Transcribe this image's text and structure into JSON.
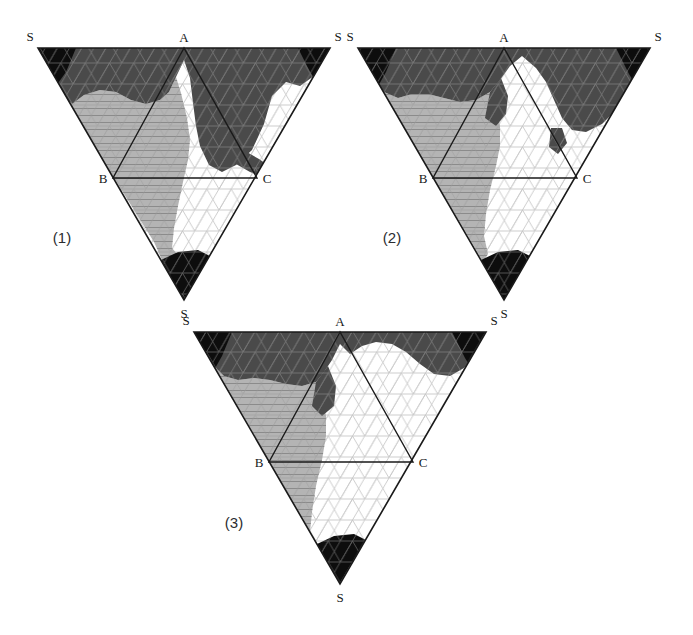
{
  "figure": {
    "type": "ternary-phase-diagrams",
    "panel_count": 3,
    "background_color": "#ffffff",
    "shared_vertex_labels": {
      "top_left": "S",
      "top_right": "S",
      "bottom": "S",
      "inner_apex": "A",
      "inner_left": "B",
      "inner_right": "C"
    },
    "shade_legend": [
      {
        "name": "black-region",
        "color": "#0d0d0d",
        "description": "darkest phase field"
      },
      {
        "name": "dark-gray-region",
        "color": "#4a4a4a",
        "description": "dark shaded phase field"
      },
      {
        "name": "light-gray-region",
        "color": "#b4b4b4",
        "description": "light shaded phase field"
      },
      {
        "name": "white-region",
        "color": "#ffffff",
        "description": "unshaded phase field"
      }
    ],
    "grid": {
      "color": "#9a9a9a",
      "divisions": 12,
      "style": "triangular-mesh"
    },
    "outline_color": "#1a1a1a"
  },
  "panels": [
    {
      "id": "panel-1",
      "caption": "(1)",
      "caption_x": 62,
      "caption_y": 243,
      "outer": {
        "left_x": 38,
        "right_x": 330,
        "top_y": 48,
        "apex_x": 184,
        "apex_y": 300
      },
      "inner": {
        "a_x": 184,
        "a_y": 48,
        "b_x": 113,
        "b_y": 178,
        "c_x": 257,
        "c_y": 178
      },
      "labels": {
        "s_left": {
          "text": "S",
          "x": 30,
          "y": 41
        },
        "s_right": {
          "text": "S",
          "x": 336,
          "y": 41
        },
        "s_bottom": {
          "text": "S",
          "x": 180,
          "y": 316
        },
        "a": {
          "text": "A",
          "x": 179,
          "y": 42
        },
        "b": {
          "text": "B",
          "x": 100,
          "y": 184
        },
        "c": {
          "text": "C",
          "x": 262,
          "y": 184
        }
      },
      "regions": {
        "dark_gray_top": "M 38,48 L 330,48 L 318,73 L 300,86 L 286,82 L 272,96 L 264,124 L 252,150 L 236,165 L 222,172 L 209,165 L 200,146 L 196,126 L 193,103 L 190,78 L 184,60 L 176,77 L 169,92 L 160,100 L 146,104 L 131,100 L 116,92 L 100,90 L 84,95 L 72,104 L 59,90 Z",
        "black_left_corner": "M 38,48 L 76,48 L 66,72 L 56,86 L 49,72 Z",
        "black_right_corner": "M 330,48 L 296,48 L 308,70 L 318,82 L 326,62 Z",
        "black_bottom": "M 184,300 L 163,262 L 178,255 L 196,252 L 212,258 Z",
        "light_gray_left": "M 59,90 L 72,104 L 84,95 L 100,90 L 116,92 L 131,100 L 146,104 L 160,100 L 169,92 L 176,77 L 181,93 L 187,118 L 190,140 L 188,160 L 183,182 L 178,206 L 174,228 L 172,248 L 178,255 L 163,262 L 154,242 Z",
        "dark_gray_right_lobe": "M 184,48 L 258,48 L 252,62 L 240,78 L 228,96 L 224,116 L 230,136 L 244,150 L 258,158 L 272,166 L 278,178 L 266,178 L 252,172 L 238,166 L 224,154 L 214,138 L 210,118 L 212,98 L 200,76 L 190,60 Z"
      }
    },
    {
      "id": "panel-2",
      "caption": "(2)",
      "caption_x": 52,
      "caption_y": 243,
      "outer": {
        "left_x": 18,
        "right_x": 310,
        "top_y": 48,
        "apex_x": 164,
        "apex_y": 300
      },
      "inner": {
        "a_x": 164,
        "a_y": 48,
        "b_x": 93,
        "b_y": 178,
        "c_x": 237,
        "c_y": 178
      },
      "labels": {
        "s_left": {
          "text": "S",
          "x": 10,
          "y": 41
        },
        "s_right": {
          "text": "S",
          "x": 316,
          "y": 41
        },
        "s_bottom": {
          "text": "S",
          "x": 160,
          "y": 316
        },
        "a": {
          "text": "A",
          "x": 159,
          "y": 42
        },
        "b": {
          "text": "B",
          "x": 80,
          "y": 184
        },
        "c": {
          "text": "C",
          "x": 242,
          "y": 184
        }
      },
      "regions": {
        "dark_gray_top": "M 18,48 L 310,48 L 300,76 L 288,92 L 276,110 L 262,124 L 246,132 L 232,130 L 222,118 L 214,100 L 206,82 L 196,68 L 182,56 L 170,66 L 160,80 L 150,92 L 136,100 L 120,102 L 104,98 L 88,94 L 72,94 L 58,98 L 44,92 L 32,74 Z",
        "black_left_corner": "M 18,48 L 56,48 L 46,72 L 38,88 L 29,70 Z",
        "black_right_corner": "M 310,48 L 278,48 L 290,72 L 299,86 L 306,62 Z",
        "black_bottom": "M 164,300 L 143,262 L 158,254 L 176,252 L 192,258 Z",
        "light_gray_left": "M 32,74 L 44,92 L 58,98 L 72,94 L 88,94 L 104,98 L 120,102 L 136,100 L 150,92 L 156,106 L 160,126 L 160,146 L 156,166 L 150,190 L 146,214 L 144,236 L 148,254 L 143,262 L 128,236 Z",
        "dark_gray_mid": "M 152,92 L 160,80 L 166,96 L 164,112 L 155,124 L 146,118 Z",
        "dark_gray_right_blob": "M 212,130 L 222,130 L 226,142 L 218,152 L 210,146 Z"
      }
    },
    {
      "id": "panel-3",
      "caption": "(3)",
      "caption_x": 64,
      "caption_y": 218,
      "outer": {
        "left_x": 24,
        "right_x": 316,
        "top_y": 22,
        "apex_x": 170,
        "apex_y": 274
      },
      "inner": {
        "a_x": 170,
        "a_y": 22,
        "b_x": 99,
        "b_y": 152,
        "c_x": 243,
        "c_y": 152
      },
      "labels": {
        "s_left": {
          "text": "S",
          "x": 16,
          "y": 15
        },
        "s_right": {
          "text": "S",
          "x": 322,
          "y": 15
        },
        "s_bottom": {
          "text": "S",
          "x": 166,
          "y": 290
        },
        "a": {
          "text": "A",
          "x": 165,
          "y": 16
        },
        "b": {
          "text": "B",
          "x": 86,
          "y": 158
        },
        "c": {
          "text": "C",
          "x": 248,
          "y": 158
        }
      },
      "regions": {
        "dark_gray_top": "M 24,22 L 316,22 L 306,44 L 294,58 L 280,66 L 264,64 L 250,54 L 236,42 L 222,34 L 206,32 L 192,36 L 180,44 L 170,36 L 162,50 L 154,62 L 146,72 L 132,76 L 116,74 L 100,70 L 84,68 L 68,70 L 54,66 L 40,52 Z",
        "black_left_corner": "M 24,22 L 62,22 L 52,46 L 44,62 L 34,44 Z",
        "black_right_corner": "M 316,22 L 284,22 L 296,46 L 305,60 L 312,36 Z",
        "black_bottom": "M 170,274 L 149,236 L 164,228 L 182,226 L 198,232 Z",
        "light_gray_left": "M 40,52 L 54,66 L 68,70 L 84,68 L 100,70 L 116,74 L 132,76 L 146,72 L 152,86 L 156,106 L 156,126 L 152,150 L 146,176 L 142,202 L 140,222 L 149,236 L 134,228 Z"
      }
    }
  ]
}
